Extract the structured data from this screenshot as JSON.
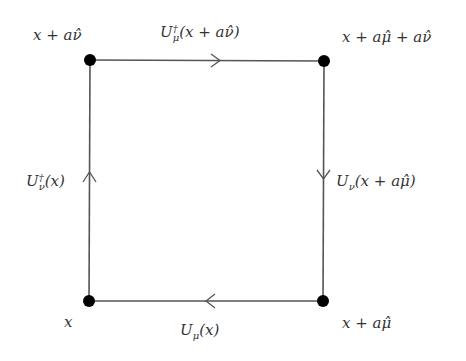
{
  "diagram": {
    "colors": {
      "line": "#555555",
      "node": "#000000",
      "text": "#333333",
      "background": "#ffffff"
    },
    "nodes": [
      {
        "id": "x",
        "label": "x",
        "pos": [
          89,
          301
        ]
      },
      {
        "id": "x_mu",
        "label": "x + aμ̂",
        "pos": [
          323,
          301
        ]
      },
      {
        "id": "x_mu_nu",
        "label": "x + aμ̂ + aν̂",
        "pos": [
          324,
          61
        ]
      },
      {
        "id": "x_nu",
        "label": "x + aν̂",
        "pos": [
          90,
          60
        ]
      }
    ],
    "edges": [
      {
        "id": "top",
        "label": "U†μ(x + aν̂)",
        "from": "x_nu",
        "to": "x_mu_nu",
        "arrow": "right"
      },
      {
        "id": "right",
        "label": "Uν(x + aμ̂)",
        "from": "x_mu_nu",
        "to": "x_mu",
        "arrow": "down"
      },
      {
        "id": "bottom",
        "label": "Uμ(x)",
        "from": "x_mu",
        "to": "x",
        "arrow": "left"
      },
      {
        "id": "left",
        "label": "U†ν(x)",
        "from": "x",
        "to": "x_nu",
        "arrow": "up"
      }
    ]
  },
  "labels": {
    "node_x_nu": "x + aν̂",
    "node_x_mu_nu": "x + aμ̂ + aν̂",
    "node_x": "x",
    "node_x_mu": "x + aμ̂",
    "edge_top_U": "U",
    "edge_top_sup": "†",
    "edge_top_sub": "μ",
    "edge_top_arg": "(x + aν̂)",
    "edge_left_U": "U",
    "edge_left_sup": "†",
    "edge_left_sub": "ν",
    "edge_left_arg": "(x)",
    "edge_right_U": "U",
    "edge_right_sub": "ν",
    "edge_right_arg": "(x + aμ̂)",
    "edge_bottom_U": "U",
    "edge_bottom_sub": "μ",
    "edge_bottom_arg": "(x)"
  }
}
